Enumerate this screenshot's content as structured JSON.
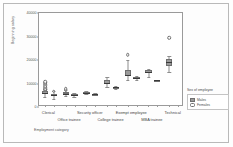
{
  "chart_data": {
    "type": "box",
    "title": "",
    "xlabel": "Employment category",
    "ylabel": "Beginning salary",
    "ylim": [
      0,
      40000
    ],
    "yticks": [
      "0",
      "10000",
      "20000",
      "30000",
      "40000"
    ],
    "ytick_values": [
      0,
      10000,
      20000,
      30000,
      40000
    ],
    "grid": false,
    "legend": {
      "title": "Sex of employee",
      "position": "right",
      "entries": [
        {
          "label": "Males",
          "color": "#9a9a9a"
        },
        {
          "label": "Females",
          "color": "#ffffff"
        }
      ]
    },
    "categories": [
      "Clerical",
      "Office trainee",
      "Security officer",
      "College trainee",
      "Exempt employee",
      "MBA trainee",
      "Technical"
    ],
    "series": [
      {
        "name": "Males",
        "boxes": [
          {
            "category": "Clerical",
            "min": 4200,
            "q1": 5400,
            "median": 6000,
            "q3": 6600,
            "max": 7800,
            "outliers": [
              8400,
              8700,
              9000,
              9600,
              10200,
              10800,
              11400,
              12000
            ]
          },
          {
            "category": "Office trainee",
            "min": 4800,
            "q1": 5400,
            "median": 5700,
            "q3": 6300,
            "max": 7200,
            "outliers": [
              8400,
              9000
            ]
          },
          {
            "category": "Security officer",
            "min": 5400,
            "q1": 5700,
            "median": 6000,
            "q3": 6300,
            "max": 6600,
            "outliers": []
          },
          {
            "category": "College trainee",
            "min": 8400,
            "q1": 9600,
            "median": 10200,
            "q3": 11400,
            "max": 12600,
            "outliers": []
          },
          {
            "category": "Exempt employee",
            "min": 11400,
            "q1": 13200,
            "median": 13800,
            "q3": 15600,
            "max": 19800,
            "outliers": [
              23400
            ]
          },
          {
            "category": "MBA trainee",
            "min": 12600,
            "q1": 14400,
            "median": 15000,
            "q3": 15600,
            "max": 16200,
            "outliers": []
          },
          {
            "category": "Technical",
            "min": 15000,
            "q1": 17400,
            "median": 19200,
            "q3": 20400,
            "max": 21600,
            "outliers": [
              30600
            ]
          }
        ]
      },
      {
        "name": "Females",
        "boxes": [
          {
            "category": "Clerical",
            "min": 3600,
            "q1": 4800,
            "median": 5100,
            "q3": 5700,
            "max": 6600,
            "outliers": [
              7800
            ]
          },
          {
            "category": "Office trainee",
            "min": 4200,
            "q1": 4800,
            "median": 5100,
            "q3": 5400,
            "max": 6000,
            "outliers": []
          },
          {
            "category": "Security officer",
            "min": 5400,
            "q1": 5700,
            "median": 5700,
            "q3": 5700,
            "max": 6000,
            "outliers": []
          },
          {
            "category": "College trainee",
            "min": 7800,
            "q1": 8100,
            "median": 8400,
            "q3": 8700,
            "max": 9000,
            "outliers": []
          },
          {
            "category": "Exempt employee",
            "min": 11400,
            "q1": 12000,
            "median": 12300,
            "q3": 12900,
            "max": 13200,
            "outliers": []
          },
          {
            "category": "MBA trainee",
            "min": 11400,
            "q1": 11400,
            "median": 11400,
            "q3": 11400,
            "max": 11400,
            "outliers": []
          },
          {
            "category": "Technical",
            "min": 0,
            "q1": 0,
            "median": 0,
            "q3": 0,
            "max": 0,
            "outliers": []
          }
        ]
      }
    ],
    "xminor_ticks": [
      "N =",
      "227",
      "157",
      "136",
      "27",
      "10",
      "32",
      "41",
      "74",
      "32",
      "48",
      "1",
      "6"
    ]
  }
}
